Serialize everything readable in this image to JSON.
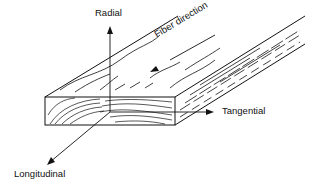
{
  "diagram": {
    "labels": {
      "radial": "Radial",
      "fiber_direction": "Fiber direction",
      "tangential": "Tangential",
      "longitudinal": "Longitudinal"
    }
  }
}
